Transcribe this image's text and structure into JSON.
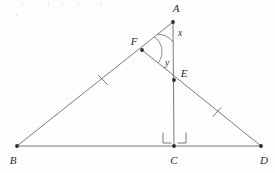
{
  "figure": {
    "kind": "euclidean-geometry-diagram",
    "width": 275,
    "height": 173,
    "background_color": "#fefefe",
    "stroke_color": "#6b6b73",
    "point_color": "#2b2b2b",
    "label_color": "#2b2b2b"
  },
  "points": {
    "A": {
      "label": "A",
      "x": 173,
      "y": 22,
      "label_x": 176,
      "label_y": 8
    },
    "B": {
      "label": "B",
      "x": 17,
      "y": 146,
      "label_x": 13,
      "label_y": 160
    },
    "C": {
      "label": "C",
      "x": 174,
      "y": 146,
      "label_x": 174,
      "label_y": 160
    },
    "D": {
      "label": "D",
      "x": 261,
      "y": 146,
      "label_x": 264,
      "label_y": 160
    },
    "E": {
      "label": "E",
      "x": 174,
      "y": 80,
      "label_x": 184,
      "label_y": 73
    },
    "F": {
      "label": "F",
      "x": 142,
      "y": 50,
      "label_x": 134,
      "label_y": 41
    }
  },
  "segments": [
    {
      "name": "segment-AB",
      "from": "A",
      "to": "B"
    },
    {
      "name": "segment-BD",
      "from": "B",
      "to": "D"
    },
    {
      "name": "segment-AC",
      "from": "A",
      "to": "C"
    },
    {
      "name": "segment-FD",
      "from": "F",
      "to": "D"
    }
  ],
  "angles": [
    {
      "name": "angle-x-at-A",
      "label": "x",
      "vertex": "A",
      "label_x": 180,
      "label_y": 34
    },
    {
      "name": "angle-y-at-F",
      "label": "y",
      "vertex": "F",
      "label_x": 167,
      "label_y": 64
    }
  ],
  "tick_marks": [
    {
      "name": "tick-on-BF",
      "segment": "segment-AB",
      "x": 103,
      "y": 80
    },
    {
      "name": "tick-on-ED",
      "segment": "segment-FD",
      "x": 217,
      "y": 112
    }
  ],
  "right_angle_marks": [
    {
      "name": "right-angle-BCA",
      "side": "left",
      "x": 165,
      "y": 137
    },
    {
      "name": "right-angle-ACD",
      "side": "right",
      "x": 183,
      "y": 137
    }
  ]
}
